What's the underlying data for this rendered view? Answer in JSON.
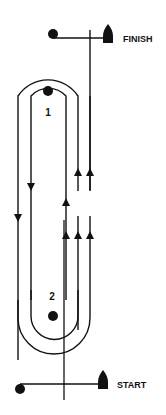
{
  "diagram": {
    "type": "sailing race course (windward-leeward)",
    "labels": {
      "finish": "FINISH",
      "start": "START",
      "mark1": "1",
      "mark2": "2"
    },
    "colors": {
      "ink": "#111111",
      "background": "#ffffff"
    }
  }
}
